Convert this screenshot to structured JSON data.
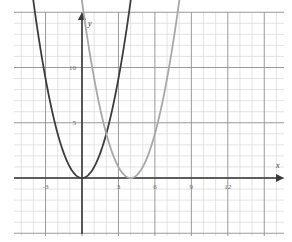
{
  "figure": {
    "title": "",
    "axis_labels": {
      "x": "x",
      "y": "y"
    },
    "background_color": "#ffffff",
    "grid": {
      "minor_color": "#d8d8d8",
      "major_color": "#8f8f8f",
      "minor_step_units": 1,
      "major_step_units": 3,
      "visible": true
    },
    "axes": {
      "color": "#3a3a3a",
      "arrow_x": true,
      "arrow_y": true,
      "origin_label": ""
    }
  },
  "chart_data": {
    "type": "line",
    "title": "",
    "xlabel": "x",
    "ylabel": "y",
    "xlim": [
      -6,
      15
    ],
    "ylim": [
      -5,
      16
    ],
    "xticks": [
      -3,
      3,
      6,
      9,
      12
    ],
    "xtick_labels": [
      "-3",
      "3",
      "6",
      "9",
      "12"
    ],
    "yticks": [
      5,
      10
    ],
    "ytick_labels": [
      "5",
      "10"
    ],
    "grid": true,
    "legend": "none",
    "series": [
      {
        "name": "y = x^2",
        "color": "#3d3d3d",
        "equation": "y = x^2",
        "vertex": [
          0,
          0
        ],
        "x": [
          -3.9,
          -3.5,
          -3,
          -2.5,
          -2,
          -1.5,
          -1,
          -0.5,
          0,
          0.5,
          1,
          1.5,
          2,
          2.5,
          3,
          3.5,
          3.9
        ],
        "values": [
          15.21,
          12.25,
          9,
          6.25,
          4,
          2.25,
          1,
          0.25,
          0,
          0.25,
          1,
          2.25,
          4,
          6.25,
          9,
          12.25,
          15.21
        ]
      },
      {
        "name": "y = (x - 4)^2",
        "color": "#a8a8a8",
        "equation": "y = (x - 4)^2",
        "vertex": [
          4,
          0
        ],
        "x": [
          0.1,
          0.5,
          1,
          1.5,
          2,
          2.5,
          3,
          3.5,
          4,
          4.5,
          5,
          5.5,
          6,
          6.5,
          7,
          7.5,
          7.9
        ],
        "values": [
          15.21,
          12.25,
          9,
          6.25,
          4,
          2.25,
          1,
          0.25,
          0,
          0.25,
          1,
          2.25,
          4,
          6.25,
          9,
          12.25,
          15.21
        ]
      }
    ],
    "annotations": [
      {
        "label": "intersection",
        "x": 2,
        "y": 4
      }
    ]
  }
}
